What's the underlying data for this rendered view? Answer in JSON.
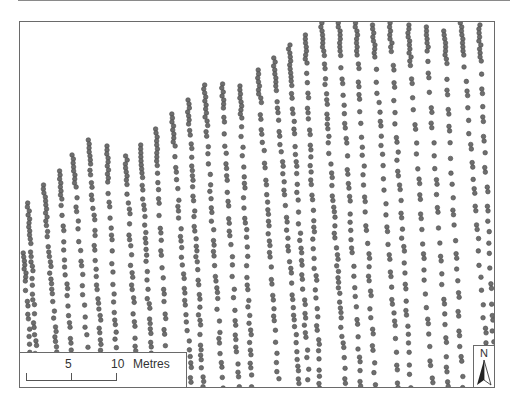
{
  "map": {
    "dot_color": "#6e6e6e",
    "dot_stroke": "#4a4a4a",
    "columns": [
      {
        "x": 23,
        "top": 252,
        "step": 9
      },
      {
        "x": 27,
        "top": 202,
        "step": 6
      },
      {
        "x": 43,
        "top": 184,
        "step": 7
      },
      {
        "x": 58,
        "top": 170,
        "step": 8
      },
      {
        "x": 72,
        "top": 154,
        "step": 9
      },
      {
        "x": 88,
        "top": 139,
        "step": 7
      },
      {
        "x": 106,
        "top": 145,
        "step": 9
      },
      {
        "x": 125,
        "top": 155,
        "step": 8
      },
      {
        "x": 140,
        "top": 144,
        "step": 7
      },
      {
        "x": 155,
        "top": 128,
        "step": 9
      },
      {
        "x": 171,
        "top": 113,
        "step": 8
      },
      {
        "x": 187,
        "top": 99,
        "step": 7
      },
      {
        "x": 203,
        "top": 84,
        "step": 8
      },
      {
        "x": 221,
        "top": 83,
        "step": 9
      },
      {
        "x": 239,
        "top": 85,
        "step": 8
      },
      {
        "x": 257,
        "top": 69,
        "step": 9
      },
      {
        "x": 273,
        "top": 57,
        "step": 8
      },
      {
        "x": 288,
        "top": 44,
        "step": 9
      },
      {
        "x": 304,
        "top": 34,
        "step": 8
      },
      {
        "x": 320,
        "top": 22,
        "step": 7
      },
      {
        "x": 338,
        "top": 22,
        "step": 10
      },
      {
        "x": 355,
        "top": 22,
        "step": 10
      },
      {
        "x": 372,
        "top": 24,
        "step": 10
      },
      {
        "x": 389,
        "top": 22,
        "step": 10
      },
      {
        "x": 407,
        "top": 24,
        "step": 11
      },
      {
        "x": 425,
        "top": 26,
        "step": 12
      },
      {
        "x": 443,
        "top": 30,
        "step": 12
      },
      {
        "x": 460,
        "top": 22,
        "step": 11
      },
      {
        "x": 478,
        "top": 24,
        "step": 12
      }
    ]
  },
  "scale_bar": {
    "label_5": "5",
    "label_10": "10",
    "unit": "Metres"
  },
  "north_arrow": {
    "label": "N"
  }
}
